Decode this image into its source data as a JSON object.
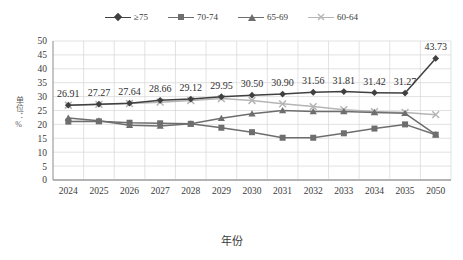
{
  "chart_data": {
    "type": "line",
    "title": "",
    "xlabel": "年份",
    "ylabel": "单位：%",
    "categories": [
      "2024",
      "2025",
      "2026",
      "2027",
      "2028",
      "2029",
      "2030",
      "2031",
      "2032",
      "2033",
      "2034",
      "2035",
      "2050"
    ],
    "ylim": [
      0,
      50
    ],
    "yticks": [
      0,
      5,
      10,
      15,
      20,
      25,
      30,
      35,
      40,
      45,
      50
    ],
    "grid": true,
    "legend_position": "top-center",
    "series": [
      {
        "name": "≥75",
        "marker": "diamond",
        "color": "#404040",
        "labelled": true,
        "values": [
          26.91,
          27.27,
          27.64,
          28.66,
          29.12,
          29.95,
          30.5,
          30.9,
          31.56,
          31.81,
          31.42,
          31.27,
          43.73
        ],
        "labels": [
          "26.91",
          "27.27",
          "27.64",
          "28.66",
          "29.12",
          "29.95",
          "30.50",
          "30.90",
          "31.56",
          "31.81",
          "31.42",
          "31.27",
          "43.73"
        ]
      },
      {
        "name": "70-74",
        "marker": "square",
        "color": "#6e6e6e",
        "labelled": false,
        "values": [
          21.0,
          21.1,
          20.6,
          20.4,
          20.2,
          18.8,
          17.2,
          15.2,
          15.2,
          16.8,
          18.5,
          20.0,
          16.3
        ]
      },
      {
        "name": "65-69",
        "marker": "triangle",
        "color": "#6e6e6e",
        "labelled": false,
        "values": [
          22.3,
          21.3,
          19.7,
          19.4,
          20.2,
          22.2,
          23.8,
          25.0,
          24.6,
          24.6,
          24.3,
          24.0,
          16.3
        ]
      },
      {
        "name": "60-64",
        "marker": "cross",
        "color": "#b5b5b5",
        "labelled": false,
        "values": [
          26.9,
          27.2,
          27.5,
          28.0,
          28.6,
          29.3,
          28.6,
          27.4,
          26.4,
          25.3,
          24.6,
          24.3,
          23.5
        ]
      }
    ]
  },
  "legend": {
    "items": [
      {
        "label": "≥75"
      },
      {
        "label": "70-74"
      },
      {
        "label": "65-69"
      },
      {
        "label": "60-64"
      }
    ]
  }
}
